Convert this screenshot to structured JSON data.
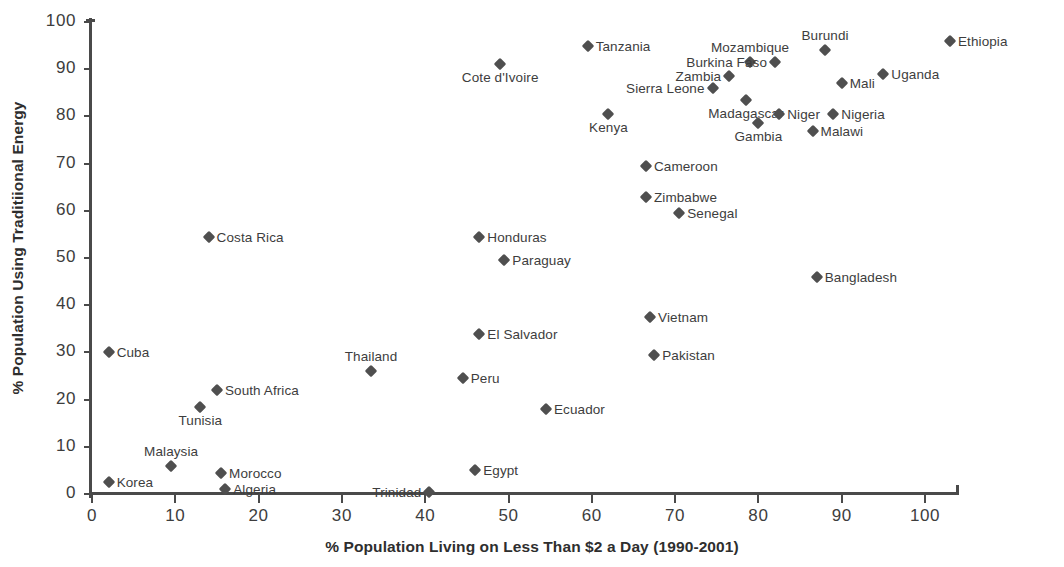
{
  "chart_data": {
    "type": "scatter",
    "title": "",
    "xlabel": "% Population Living on Less Than $2 a Day (1990-2001)",
    "ylabel": "% Population Using Traditiional Energy",
    "xlim": [
      0,
      100
    ],
    "ylim": [
      0,
      100
    ],
    "xticks": [
      0,
      10,
      20,
      30,
      40,
      50,
      60,
      70,
      80,
      90,
      100
    ],
    "yticks": [
      0,
      10,
      20,
      30,
      40,
      50,
      60,
      70,
      80,
      90,
      100
    ],
    "grid": false,
    "legend": "none",
    "marker": "diamond",
    "marker_color": "#4f4f4f",
    "points": [
      {
        "label": "Korea",
        "x": 2,
        "y": 2.5,
        "pos": "right"
      },
      {
        "label": "Cuba",
        "x": 2,
        "y": 30,
        "pos": "right"
      },
      {
        "label": "Malaysia",
        "x": 9.5,
        "y": 6,
        "pos": "above"
      },
      {
        "label": "Tunisia",
        "x": 13,
        "y": 18.5,
        "pos": "below"
      },
      {
        "label": "Costa Rica",
        "x": 14,
        "y": 54.5,
        "pos": "right"
      },
      {
        "label": "South Africa",
        "x": 15,
        "y": 22,
        "pos": "right"
      },
      {
        "label": "Morocco",
        "x": 15.5,
        "y": 4.5,
        "pos": "right"
      },
      {
        "label": "Algeria",
        "x": 16,
        "y": 1,
        "pos": "right"
      },
      {
        "label": "Thailand",
        "x": 33.5,
        "y": 26,
        "pos": "above"
      },
      {
        "label": "Trinidad",
        "x": 40.5,
        "y": 0.5,
        "pos": "left"
      },
      {
        "label": "Peru",
        "x": 44.5,
        "y": 24.5,
        "pos": "right"
      },
      {
        "label": "Egypt",
        "x": 46,
        "y": 5,
        "pos": "right"
      },
      {
        "label": "Honduras",
        "x": 46.5,
        "y": 54.5,
        "pos": "right"
      },
      {
        "label": "El Salvador",
        "x": 46.5,
        "y": 34,
        "pos": "right"
      },
      {
        "label": "Cote d'Ivoire",
        "x": 49,
        "y": 91,
        "pos": "below"
      },
      {
        "label": "Paraguay",
        "x": 49.5,
        "y": 49.5,
        "pos": "right"
      },
      {
        "label": "Ecuador",
        "x": 54.5,
        "y": 18,
        "pos": "right"
      },
      {
        "label": "Tanzania",
        "x": 59.5,
        "y": 95,
        "pos": "right"
      },
      {
        "label": "Kenya",
        "x": 62,
        "y": 80.5,
        "pos": "below"
      },
      {
        "label": "Cameroon",
        "x": 66.5,
        "y": 69.5,
        "pos": "right"
      },
      {
        "label": "Zimbabwe",
        "x": 66.5,
        "y": 63,
        "pos": "right"
      },
      {
        "label": "Vietnam",
        "x": 67,
        "y": 37.5,
        "pos": "right"
      },
      {
        "label": "Pakistan",
        "x": 67.5,
        "y": 29.5,
        "pos": "right"
      },
      {
        "label": "Senegal",
        "x": 70.5,
        "y": 59.5,
        "pos": "right"
      },
      {
        "label": "Sierra Leone",
        "x": 74.5,
        "y": 86,
        "pos": "left"
      },
      {
        "label": "Zambia",
        "x": 76.5,
        "y": 88.5,
        "pos": "left"
      },
      {
        "label": "Madagascar",
        "x": 78.5,
        "y": 83.5,
        "pos": "below"
      },
      {
        "label": "Mozambique",
        "x": 79,
        "y": 91.5,
        "pos": "above"
      },
      {
        "label": "Gambia",
        "x": 80,
        "y": 78.5,
        "pos": "below"
      },
      {
        "label": "Burkina Faso",
        "x": 82,
        "y": 91.5,
        "pos": "left"
      },
      {
        "label": "Niger",
        "x": 82.5,
        "y": 80.5,
        "pos": "right"
      },
      {
        "label": "Malawi",
        "x": 86.5,
        "y": 77,
        "pos": "right"
      },
      {
        "label": "Bangladesh",
        "x": 87,
        "y": 46,
        "pos": "right"
      },
      {
        "label": "Burundi",
        "x": 88,
        "y": 94,
        "pos": "above"
      },
      {
        "label": "Nigeria",
        "x": 89,
        "y": 80.5,
        "pos": "right"
      },
      {
        "label": "Mali",
        "x": 90,
        "y": 87,
        "pos": "right"
      },
      {
        "label": "Uganda",
        "x": 95,
        "y": 89,
        "pos": "right"
      },
      {
        "label": "Ethiopia",
        "x": 103,
        "y": 96,
        "pos": "right"
      }
    ]
  }
}
